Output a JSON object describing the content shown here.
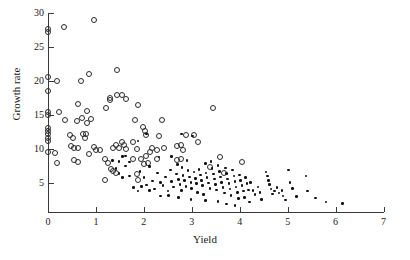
{
  "chart_data": {
    "type": "scatter",
    "title": "",
    "xlabel": "Yield",
    "ylabel": "Growth rate",
    "xlim": [
      0,
      7
    ],
    "ylim": [
      0.6,
      30
    ],
    "xticks": [
      0,
      1,
      2,
      3,
      4,
      5,
      6,
      7
    ],
    "xtick_labels": [
      "0",
      "1",
      "2",
      "3",
      "4",
      "5",
      "6",
      "7"
    ],
    "yticks": [
      5,
      10,
      15,
      20,
      25,
      30
    ],
    "ytick_labels": [
      "5",
      "10",
      "15",
      "20",
      "25",
      "30"
    ],
    "grid": false,
    "legend": "none",
    "marker_colors": {
      "open": "#2b2b2b",
      "filled": "#111111"
    },
    "series": [
      {
        "name": "open-circles",
        "marker": "open-circle",
        "points": [
          [
            0.0,
            27.7
          ],
          [
            0.0,
            27.2
          ],
          [
            0.33,
            28.0
          ],
          [
            0.95,
            29.0
          ],
          [
            0.0,
            20.6
          ],
          [
            0.18,
            20.0
          ],
          [
            0.85,
            21.0
          ],
          [
            1.45,
            21.6
          ],
          [
            0.0,
            18.5
          ],
          [
            0.68,
            20.0
          ],
          [
            0.0,
            15.4
          ],
          [
            0.22,
            15.4
          ],
          [
            0.0,
            15.0
          ],
          [
            0.62,
            16.6
          ],
          [
            1.3,
            17.5
          ],
          [
            1.45,
            18.0
          ],
          [
            1.55,
            17.9
          ],
          [
            1.62,
            17.4
          ],
          [
            1.3,
            17.2
          ],
          [
            0.82,
            15.6
          ],
          [
            1.22,
            16.1
          ],
          [
            1.88,
            16.5
          ],
          [
            0.35,
            14.3
          ],
          [
            0.6,
            14.1
          ],
          [
            0.7,
            14.6
          ],
          [
            0.82,
            13.8
          ],
          [
            0.9,
            14.4
          ],
          [
            1.82,
            14.3
          ],
          [
            2.38,
            14.2
          ],
          [
            0.0,
            13.1
          ],
          [
            0.0,
            12.7
          ],
          [
            0.0,
            12.2
          ],
          [
            0.0,
            11.6
          ],
          [
            0.0,
            11.2
          ],
          [
            0.45,
            12.1
          ],
          [
            0.52,
            11.6
          ],
          [
            0.72,
            12.2
          ],
          [
            0.78,
            11.6
          ],
          [
            0.8,
            12.2
          ],
          [
            1.98,
            13.2
          ],
          [
            2.02,
            12.6
          ],
          [
            2.05,
            12.0
          ],
          [
            2.32,
            11.9
          ],
          [
            2.88,
            12.1
          ],
          [
            3.05,
            12.1
          ],
          [
            3.12,
            11.0
          ],
          [
            3.45,
            16.1
          ],
          [
            0.0,
            9.5
          ],
          [
            0.15,
            9.4
          ],
          [
            0.48,
            10.5
          ],
          [
            0.55,
            10.2
          ],
          [
            0.62,
            10.1
          ],
          [
            0.95,
            10.3
          ],
          [
            1.0,
            9.9
          ],
          [
            1.08,
            9.9
          ],
          [
            1.35,
            10.2
          ],
          [
            1.42,
            10.6
          ],
          [
            1.48,
            10.2
          ],
          [
            1.55,
            11.1
          ],
          [
            1.58,
            10.6
          ],
          [
            1.62,
            10.0
          ],
          [
            1.78,
            11.1
          ],
          [
            1.85,
            10.0
          ],
          [
            2.05,
            9.0
          ],
          [
            2.12,
            9.6
          ],
          [
            2.18,
            10.1
          ],
          [
            2.28,
            9.8
          ],
          [
            2.42,
            10.2
          ],
          [
            2.7,
            10.4
          ],
          [
            2.78,
            10.6
          ],
          [
            2.82,
            9.9
          ],
          [
            0.18,
            7.9
          ],
          [
            0.55,
            8.4
          ],
          [
            0.62,
            8.1
          ],
          [
            0.85,
            9.3
          ],
          [
            1.18,
            8.5
          ],
          [
            1.25,
            8.0
          ],
          [
            1.32,
            7.0
          ],
          [
            1.35,
            6.8
          ],
          [
            1.42,
            6.5
          ],
          [
            1.78,
            8.5
          ],
          [
            1.85,
            6.3
          ],
          [
            1.95,
            8.5
          ],
          [
            2.0,
            7.8
          ],
          [
            2.08,
            8.0
          ],
          [
            2.28,
            8.6
          ],
          [
            2.7,
            8.4
          ],
          [
            2.78,
            8.5
          ],
          [
            3.38,
            7.4
          ],
          [
            3.58,
            8.8
          ],
          [
            3.68,
            6.4
          ],
          [
            4.05,
            8.1
          ],
          [
            1.18,
            5.4
          ],
          [
            1.88,
            5.5
          ]
        ]
      },
      {
        "name": "filled-dots",
        "marker": "filled-dot",
        "points": [
          [
            1.42,
            7.1
          ],
          [
            1.48,
            6.4
          ],
          [
            1.55,
            5.8
          ],
          [
            1.62,
            7.5
          ],
          [
            1.7,
            6.0
          ],
          [
            1.78,
            4.3
          ],
          [
            1.88,
            11.2
          ],
          [
            1.92,
            6.7
          ],
          [
            2.0,
            5.8
          ],
          [
            2.05,
            4.7
          ],
          [
            2.12,
            7.4
          ],
          [
            2.18,
            5.3
          ],
          [
            2.22,
            4.1
          ],
          [
            2.28,
            6.5
          ],
          [
            2.35,
            5.1
          ],
          [
            2.4,
            4.6
          ],
          [
            2.45,
            5.9
          ],
          [
            2.5,
            3.8
          ],
          [
            2.55,
            6.9
          ],
          [
            2.58,
            5.2
          ],
          [
            2.62,
            4.4
          ],
          [
            2.68,
            6.3
          ],
          [
            2.7,
            7.7
          ],
          [
            2.72,
            5.5
          ],
          [
            2.75,
            4.8
          ],
          [
            2.78,
            3.9
          ],
          [
            2.8,
            7.3
          ],
          [
            2.82,
            6.1
          ],
          [
            2.85,
            5.4
          ],
          [
            2.88,
            4.5
          ],
          [
            2.9,
            8.3
          ],
          [
            2.92,
            6.8
          ],
          [
            2.95,
            5.9
          ],
          [
            2.98,
            5.1
          ],
          [
            3.0,
            4.2
          ],
          [
            3.02,
            11.9
          ],
          [
            3.05,
            6.6
          ],
          [
            3.08,
            5.7
          ],
          [
            3.1,
            4.9
          ],
          [
            3.12,
            3.6
          ],
          [
            3.15,
            7.0
          ],
          [
            3.18,
            6.2
          ],
          [
            3.2,
            5.4
          ],
          [
            3.22,
            4.6
          ],
          [
            3.25,
            3.3
          ],
          [
            3.28,
            7.9
          ],
          [
            3.3,
            6.5
          ],
          [
            3.32,
            5.8
          ],
          [
            3.35,
            5.0
          ],
          [
            3.38,
            4.2
          ],
          [
            3.4,
            8.2
          ],
          [
            3.42,
            7.1
          ],
          [
            3.45,
            6.3
          ],
          [
            3.48,
            5.6
          ],
          [
            3.5,
            4.8
          ],
          [
            3.52,
            4.0
          ],
          [
            3.55,
            7.6
          ],
          [
            3.58,
            6.7
          ],
          [
            3.6,
            5.9
          ],
          [
            3.62,
            5.1
          ],
          [
            3.65,
            4.3
          ],
          [
            3.68,
            3.5
          ],
          [
            3.7,
            7.2
          ],
          [
            3.72,
            6.4
          ],
          [
            3.75,
            5.6
          ],
          [
            3.78,
            4.9
          ],
          [
            3.8,
            4.1
          ],
          [
            3.82,
            3.2
          ],
          [
            3.85,
            6.9
          ],
          [
            3.88,
            6.0
          ],
          [
            3.9,
            5.2
          ],
          [
            3.92,
            4.4
          ],
          [
            3.95,
            3.6
          ],
          [
            3.98,
            2.7
          ],
          [
            4.0,
            6.2
          ],
          [
            4.02,
            5.4
          ],
          [
            4.05,
            4.6
          ],
          [
            4.08,
            3.8
          ],
          [
            4.1,
            2.9
          ],
          [
            4.12,
            5.8
          ],
          [
            4.15,
            4.9
          ],
          [
            4.18,
            4.0
          ],
          [
            4.22,
            5.1
          ],
          [
            4.28,
            3.9
          ],
          [
            4.32,
            3.3
          ],
          [
            4.38,
            4.4
          ],
          [
            4.42,
            3.6
          ],
          [
            4.55,
            6.6
          ],
          [
            4.58,
            6.0
          ],
          [
            4.6,
            5.4
          ],
          [
            4.62,
            4.8
          ],
          [
            4.65,
            4.1
          ],
          [
            4.68,
            3.4
          ],
          [
            4.72,
            3.8
          ],
          [
            4.78,
            4.3
          ],
          [
            4.82,
            3.5
          ],
          [
            4.88,
            3.9
          ],
          [
            4.95,
            2.5
          ],
          [
            5.02,
            6.9
          ],
          [
            5.05,
            5.1
          ],
          [
            5.1,
            4.2
          ],
          [
            5.18,
            3.0
          ],
          [
            5.38,
            6.0
          ],
          [
            5.42,
            3.8
          ],
          [
            5.58,
            2.8
          ],
          [
            5.8,
            2.2
          ],
          [
            6.15,
            2.0
          ],
          [
            2.05,
            12.2
          ],
          [
            2.32,
            8.8
          ],
          [
            2.58,
            8.9
          ],
          [
            2.78,
            12.2
          ],
          [
            1.62,
            9.0
          ],
          [
            1.55,
            8.9
          ],
          [
            1.35,
            8.3
          ],
          [
            1.48,
            8.2
          ],
          [
            1.7,
            8.1
          ],
          [
            1.95,
            4.5
          ],
          [
            2.12,
            3.9
          ],
          [
            2.35,
            3.1
          ],
          [
            2.52,
            3.2
          ],
          [
            1.88,
            3.8
          ],
          [
            2.72,
            2.9
          ],
          [
            2.98,
            2.6
          ],
          [
            3.28,
            2.4
          ],
          [
            3.55,
            2.3
          ],
          [
            3.72,
            1.9
          ],
          [
            3.9,
            1.7
          ],
          [
            4.2,
            2.2
          ],
          [
            4.45,
            2.6
          ],
          [
            4.9,
            3.1
          ]
        ]
      }
    ]
  }
}
